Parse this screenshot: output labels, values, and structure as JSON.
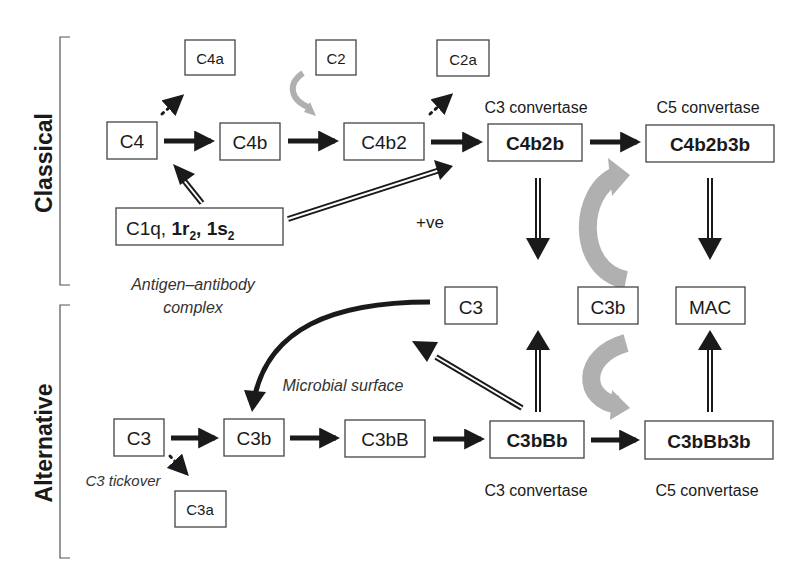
{
  "diagram": {
    "sections": {
      "classical": "Classical",
      "alternative": "Alternative"
    },
    "nodes": {
      "c4": "C4",
      "c4a": "C4a",
      "c4b": "C4b",
      "c2": "C2",
      "c2a": "C2a",
      "c4b2": "C4b2",
      "c4b2b": "C4b2b",
      "c4b2b3b": "C4b2b3b",
      "c1_part1": "C1q, ",
      "c1_r": "1r",
      "c1_sub1": "2",
      "c1_sep": ", ",
      "c1_s": "1s",
      "c1_sub2": "2",
      "c3_mid": "C3",
      "c3b_mid": "C3b",
      "mac": "MAC",
      "c3_alt": "C3",
      "c3b_alt": "C3b",
      "c3bB": "C3bB",
      "c3bBb": "C3bBb",
      "c3bBb3b": "C3bBb3b",
      "c3a": "C3a"
    },
    "labels": {
      "c3_convertase_top": "C3 convertase",
      "c5_convertase_top": "C5 convertase",
      "c3_convertase_bottom": "C3 convertase",
      "c5_convertase_bottom": "C5 convertase",
      "positive": "+ve",
      "antigen_line1": "Antigen–antibody",
      "antigen_line2": "complex",
      "microbial_surface": "Microbial surface",
      "c3_tickover": "C3 tickover"
    },
    "colors": {
      "arrow": "#1a1a1a",
      "feedback_arrow": "#b0b0b0",
      "box_border": "#444444"
    }
  }
}
